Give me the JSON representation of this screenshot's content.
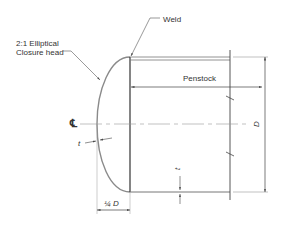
{
  "diagram": {
    "labels": {
      "head_line1": "2:1 Elliptical",
      "head_line2": "Closure head",
      "weld": "Weld",
      "penstock": "Penstock",
      "centerline": "℄",
      "head_thickness": "t",
      "shell_thickness": "t",
      "diameter": "D",
      "head_depth": "¼ D"
    },
    "colors": {
      "line": "#555555",
      "head": "#8a8a8a",
      "text": "#333333"
    }
  }
}
